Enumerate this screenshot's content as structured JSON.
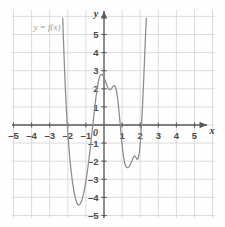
{
  "chart_data": {
    "type": "line",
    "title": "",
    "subtitle": "",
    "xlabel": "x",
    "ylabel": "y",
    "xlim": [
      -5.6,
      5.8
    ],
    "ylim": [
      -5.5,
      5.9
    ],
    "grid": true,
    "grid_step": 1,
    "legend_position": "top-left",
    "annotations": [
      {
        "text": "y = f(x)",
        "x": -3.9,
        "y": 5.25
      }
    ],
    "x_ticks": [
      -5,
      -4,
      -3,
      -2,
      -1,
      1,
      2,
      3,
      4,
      5
    ],
    "x_tick_labels": [
      "–5",
      "–4",
      "–3",
      "–2",
      "–1",
      "1",
      "2",
      "3",
      "4",
      "5"
    ],
    "y_ticks": [
      5,
      4,
      3,
      2,
      1,
      -1,
      -2,
      -3,
      -4,
      -5
    ],
    "y_tick_labels": [
      "5",
      "4",
      "3",
      "2",
      "1",
      "–1",
      "–2",
      "–3",
      "–4",
      "–5"
    ],
    "origin_label": "0",
    "series": [
      {
        "name": "y = f(x)",
        "color": "#8c8c8c",
        "roots": [
          -2.1,
          -0.75,
          1.05,
          2.15
        ],
        "local_extrema": [
          {
            "type": "minimum",
            "x": -1.5,
            "y": -4.4
          },
          {
            "type": "maximum",
            "x": 0.35,
            "y": 2.2
          },
          {
            "type": "minimum",
            "x": 1.7,
            "y": -1.8
          }
        ],
        "points": [
          [
            -2.28,
            5.9
          ],
          [
            -2.24,
            4.7
          ],
          [
            -2.2,
            3.6
          ],
          [
            -2.16,
            2.6
          ],
          [
            -2.12,
            1.7
          ],
          [
            -2.08,
            0.9
          ],
          [
            -2.04,
            0.2
          ],
          [
            -2.0,
            -0.42
          ],
          [
            -1.95,
            -1.1
          ],
          [
            -1.9,
            -1.7
          ],
          [
            -1.85,
            -2.22
          ],
          [
            -1.8,
            -2.68
          ],
          [
            -1.75,
            -3.08
          ],
          [
            -1.7,
            -3.42
          ],
          [
            -1.65,
            -3.72
          ],
          [
            -1.6,
            -3.97
          ],
          [
            -1.55,
            -4.16
          ],
          [
            -1.5,
            -4.3
          ],
          [
            -1.45,
            -4.39
          ],
          [
            -1.4,
            -4.42
          ],
          [
            -1.35,
            -4.4
          ],
          [
            -1.3,
            -4.34
          ],
          [
            -1.25,
            -4.23
          ],
          [
            -1.2,
            -4.08
          ],
          [
            -1.15,
            -3.89
          ],
          [
            -1.1,
            -3.66
          ],
          [
            -1.05,
            -3.4
          ],
          [
            -1.0,
            -3.1
          ],
          [
            -0.95,
            -2.77
          ],
          [
            -0.9,
            -2.41
          ],
          [
            -0.85,
            -2.03
          ],
          [
            -0.8,
            -1.62
          ],
          [
            -0.75,
            -1.19
          ],
          [
            -0.7,
            -0.75
          ],
          [
            -0.65,
            -0.29
          ],
          [
            -0.6,
            0.17
          ],
          [
            -0.55,
            0.63
          ],
          [
            -0.5,
            1.08
          ],
          [
            -0.45,
            1.5
          ],
          [
            -0.4,
            1.88
          ],
          [
            -0.35,
            2.2
          ],
          [
            -0.3,
            2.46
          ],
          [
            -0.25,
            2.64
          ],
          [
            -0.2,
            2.75
          ],
          [
            -0.15,
            2.8
          ],
          [
            -0.1,
            2.79
          ],
          [
            -0.05,
            2.73
          ],
          [
            0.0,
            2.63
          ],
          [
            0.05,
            2.5
          ],
          [
            0.1,
            2.36
          ],
          [
            0.15,
            2.22
          ],
          [
            0.2,
            2.1
          ],
          [
            0.25,
            2.01
          ],
          [
            0.3,
            1.96
          ],
          [
            0.35,
            1.96
          ],
          [
            0.4,
            2.0
          ],
          [
            0.45,
            2.07
          ],
          [
            0.5,
            2.14
          ],
          [
            0.55,
            2.18
          ],
          [
            0.6,
            2.16
          ],
          [
            0.65,
            2.05
          ],
          [
            0.7,
            1.83
          ],
          [
            0.75,
            1.5
          ],
          [
            0.8,
            1.06
          ],
          [
            0.85,
            0.54
          ],
          [
            0.9,
            -0.02
          ],
          [
            0.95,
            -0.58
          ],
          [
            1.0,
            -1.1
          ],
          [
            1.05,
            -1.54
          ],
          [
            1.1,
            -1.88
          ],
          [
            1.15,
            -2.12
          ],
          [
            1.2,
            -2.27
          ],
          [
            1.25,
            -2.34
          ],
          [
            1.3,
            -2.36
          ],
          [
            1.35,
            -2.33
          ],
          [
            1.4,
            -2.27
          ],
          [
            1.45,
            -2.19
          ],
          [
            1.5,
            -2.08
          ],
          [
            1.55,
            -1.96
          ],
          [
            1.6,
            -1.83
          ],
          [
            1.65,
            -1.74
          ],
          [
            1.7,
            -1.72
          ],
          [
            1.75,
            -1.76
          ],
          [
            1.8,
            -1.86
          ],
          [
            1.85,
            -1.9
          ],
          [
            1.9,
            -1.8
          ],
          [
            1.95,
            -1.52
          ],
          [
            2.0,
            -1.04
          ],
          [
            2.05,
            -0.36
          ],
          [
            2.1,
            0.5
          ],
          [
            2.15,
            1.52
          ],
          [
            2.2,
            2.66
          ],
          [
            2.25,
            3.88
          ],
          [
            2.3,
            5.12
          ],
          [
            2.34,
            5.9
          ]
        ]
      }
    ]
  },
  "figure": {
    "x_axis_label": "x",
    "y_axis_label": "y",
    "function_label": "y = f(x)",
    "origin_label": "0",
    "axis_color": "#5a5a5a",
    "grid_color": "#d8d8d8",
    "curve_color": "#8c8c8c",
    "background": "#fefefe"
  }
}
